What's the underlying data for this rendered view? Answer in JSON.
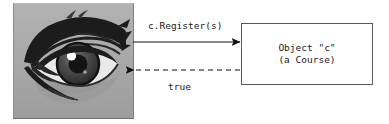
{
  "diagram": {
    "type": "sequence-interaction",
    "actor": {
      "name": "eye-photograph",
      "alt": "Photograph of a human eye",
      "colors": {
        "background": "#a9a9a9",
        "brow": "#1c1c1c",
        "sclera": "#e8e8e8",
        "iris": "#4a4a4a",
        "pupil": "#151515",
        "highlight": "#ffffff",
        "skin_shadow": "#9a9a9a"
      }
    },
    "messages": [
      {
        "id": "call",
        "label": "c.Register(s)",
        "style": "solid",
        "direction": "right",
        "from": "actor",
        "to": "object-c"
      },
      {
        "id": "return",
        "label": "true",
        "style": "dashed",
        "direction": "left",
        "from": "object-c",
        "to": "actor"
      }
    ],
    "object": {
      "name": "object-c",
      "lines": [
        "Object \"c\"",
        "(a Course)"
      ],
      "line1": "Object \"c\"",
      "line2": "(a Course)",
      "border_color": "#5a5a5a",
      "fill": "#ffffff"
    },
    "arrow_color": "#111111"
  }
}
